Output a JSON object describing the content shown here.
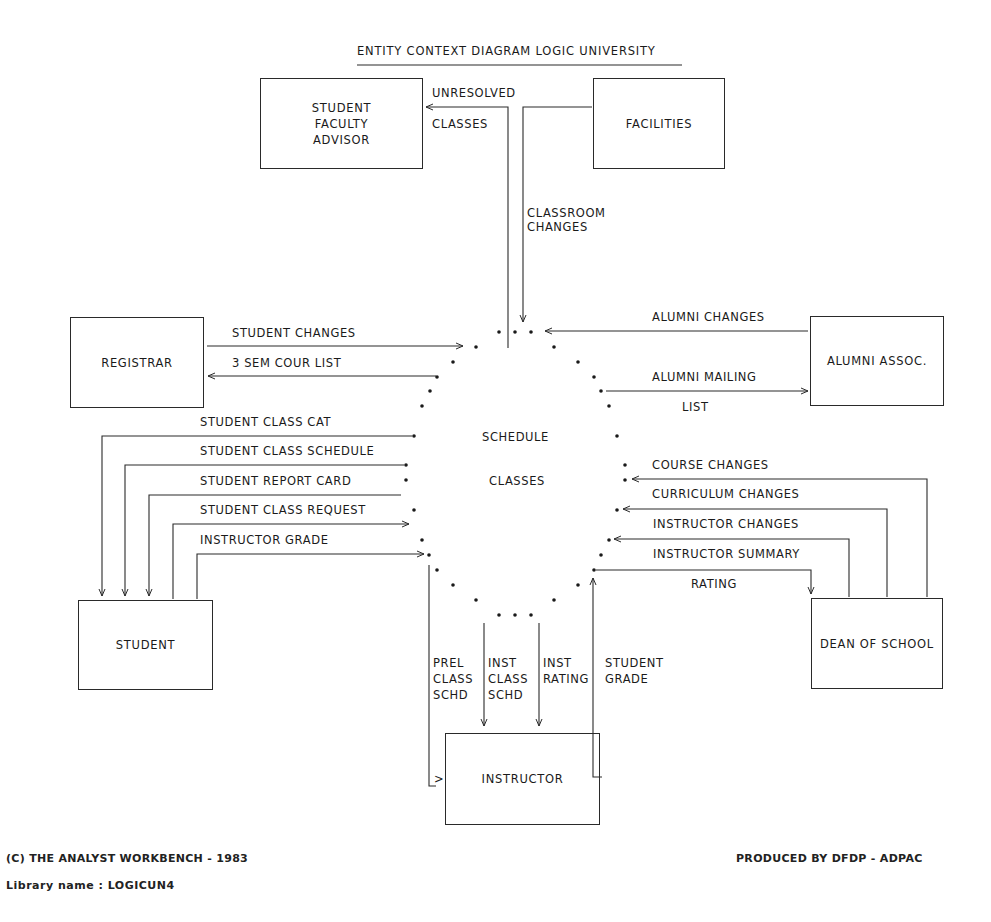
{
  "diagram": {
    "title": "ENTITY CONTEXT DIAGRAM  LOGIC UNIVERSITY",
    "process": {
      "line1": "SCHEDULE",
      "line2": "CLASSES"
    },
    "entities": {
      "advisor": "STUDENT\nFACULTY\nADVISOR",
      "facilities": "FACILITIES",
      "registrar": "REGISTRAR",
      "alumni": "ALUMNI ASSOC.",
      "student": "STUDENT",
      "dean": "DEAN OF SCHOOL",
      "instructor": "INSTRUCTOR"
    },
    "flows": {
      "unresolved_classes_1": "UNRESOLVED",
      "unresolved_classes_2": "CLASSES",
      "classroom_changes": "CLASSROOM\nCHANGES",
      "student_changes": "STUDENT CHANGES",
      "sem_cour_list": "3 SEM COUR LIST",
      "alumni_changes": "ALUMNI CHANGES",
      "alumni_mailing_1": "ALUMNI MAILING",
      "alumni_mailing_2": "LIST",
      "student_class_cat": "STUDENT CLASS CAT",
      "student_class_schedule": "STUDENT CLASS SCHEDULE",
      "student_report_card": "STUDENT REPORT CARD",
      "student_class_request": "STUDENT CLASS REQUEST",
      "instructor_grade": "INSTRUCTOR GRADE",
      "course_changes": "COURSE CHANGES",
      "curriculum_changes": "CURRICULUM CHANGES",
      "instructor_changes": "INSTRUCTOR CHANGES",
      "instructor_summary_1": "INSTRUCTOR SUMMARY",
      "instructor_summary_2": "RATING",
      "prel_class_schd": "PREL\nCLASS\nSCHD",
      "inst_class_schd": "INST\nCLASS\nSCHD",
      "inst_rating": "INST\nRATING",
      "student_grade": "STUDENT\nGRADE",
      "instructor_in_marker": ">"
    }
  },
  "footer": {
    "copyright": "(C) THE ANALYST WORKBENCH - 1983",
    "produced_by": "PRODUCED BY DFDP - ADPAC",
    "library": "Library name : LOGICUN4"
  }
}
